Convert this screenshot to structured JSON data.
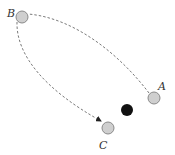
{
  "diagram": {
    "nodes": [
      {
        "id": "A",
        "label": "A",
        "cx": 154,
        "cy": 98,
        "r": 6,
        "fill": "#cfcfcf",
        "stroke": "#8a8a8a",
        "lx": 160,
        "ly": 91
      },
      {
        "id": "B",
        "label": "B",
        "cx": 22,
        "cy": 17,
        "r": 6,
        "fill": "#cfcfcf",
        "stroke": "#8a8a8a",
        "lx": 8,
        "ly": 17
      },
      {
        "id": "C",
        "label": "C",
        "cx": 108,
        "cy": 128,
        "r": 6,
        "fill": "#cfcfcf",
        "stroke": "#8a8a8a",
        "lx": 99,
        "ly": 148
      }
    ],
    "obstacle": {
      "cx": 127,
      "cy": 110,
      "r": 6,
      "fill": "#111111"
    },
    "path": {
      "color": "#7a7a7a",
      "dash": "2.5,2",
      "segment1_from": "A",
      "segment1_to": "B",
      "segment2_from": "B",
      "segment2_to": "C",
      "arrow_at": "C"
    }
  }
}
